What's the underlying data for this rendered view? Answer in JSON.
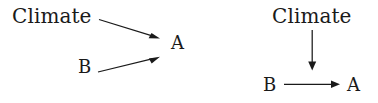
{
  "figure": {
    "background_color": "#ffffff",
    "ink_color": "#1a1a1a",
    "width": 378,
    "height": 103
  },
  "diagram_data": {
    "type": "diagram",
    "subtype": "causal-graph",
    "panel_count": 2,
    "panels": [
      {
        "id": "left",
        "nodes": [
          {
            "id": "climate",
            "label": "Climate",
            "x": 55,
            "y": 19
          },
          {
            "id": "b",
            "label": "B",
            "x": 85,
            "y": 67
          },
          {
            "id": "a",
            "label": "A",
            "x": 180,
            "y": 44
          }
        ],
        "edges": [
          {
            "from": "climate",
            "to": "a",
            "style": "solid",
            "arrowhead": "filled-triangle",
            "x1": 99,
            "y1": 19,
            "x2": 160,
            "y2": 38
          },
          {
            "from": "b",
            "to": "a",
            "style": "solid",
            "arrowhead": "filled-triangle",
            "x1": 98,
            "y1": 72,
            "x2": 160,
            "y2": 57
          }
        ]
      },
      {
        "id": "right",
        "nodes": [
          {
            "id": "climate",
            "label": "Climate",
            "x": 313,
            "y": 19
          },
          {
            "id": "b",
            "label": "B",
            "x": 270,
            "y": 85
          },
          {
            "id": "a",
            "label": "A",
            "x": 355,
            "y": 85
          }
        ],
        "edges": [
          {
            "from": "climate",
            "to": "edge_b_a",
            "style": "solid",
            "arrowhead": "filled-triangle",
            "x1": 312,
            "y1": 30,
            "x2": 312,
            "y2": 70
          },
          {
            "from": "b",
            "to": "a",
            "style": "solid",
            "arrowhead": "filled-triangle",
            "x1": 284,
            "y1": 84,
            "x2": 340,
            "y2": 84
          }
        ]
      }
    ]
  },
  "labels": {
    "left": {
      "climate": "Climate",
      "b": "B",
      "a": "A"
    },
    "right": {
      "climate": "Climate",
      "b": "B",
      "a": "A"
    }
  }
}
